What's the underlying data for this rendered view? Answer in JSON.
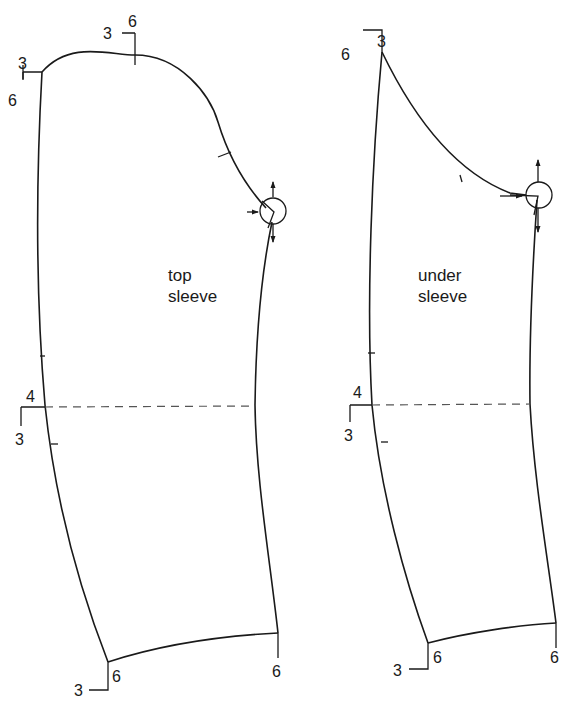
{
  "pieces": [
    {
      "name": "top sleeve",
      "label_line1": "top",
      "label_line2": "sleeve",
      "marks": {
        "crown_left": {
          "a": "3",
          "b": "6"
        },
        "crown_top": {
          "a": "3",
          "b": "6"
        },
        "elbow": {
          "a": "4",
          "b": "3"
        },
        "hem_left": {
          "a": "6",
          "b": "3"
        },
        "hem_right": {
          "a": "6"
        }
      }
    },
    {
      "name": "under sleeve",
      "label_line1": "under",
      "label_line2": "sleeve",
      "marks": {
        "crown_top": {
          "a": "6",
          "b": "3"
        },
        "elbow": {
          "a": "4",
          "b": "3"
        },
        "hem_left": {
          "a": "6",
          "b": "3"
        },
        "hem_right": {
          "a": "6"
        }
      }
    }
  ],
  "colors": {
    "line": "#1a1a1a",
    "dash": "#555555",
    "background": "#ffffff"
  }
}
